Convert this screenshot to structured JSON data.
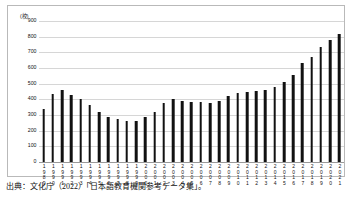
{
  "figure": {
    "source_caption": "出典：文化庁（2022）「日本語教育機関参考データ集」。"
  },
  "chart_data": {
    "type": "bar",
    "title": "",
    "subtitle": "",
    "xlabel": "(年)",
    "ylabel": "(校)",
    "ylim": [
      0,
      900
    ],
    "ytick_step": 100,
    "yticks": [
      0,
      100,
      200,
      300,
      400,
      500,
      600,
      700,
      800,
      900
    ],
    "ytick_labels": [
      "0",
      "100",
      "200",
      "300",
      "400",
      "500",
      "600",
      "700",
      "800",
      "900"
    ],
    "grid": true,
    "legend": false,
    "bar_color": "#111111",
    "gridline_color": "#d6d6d6",
    "categories": [
      "1989",
      "1990",
      "1991",
      "1992",
      "1993",
      "1994",
      "1995",
      "1996",
      "1997",
      "1998",
      "1999",
      "2000",
      "2001",
      "2002",
      "2003",
      "2004",
      "2005",
      "2006",
      "2007",
      "2008",
      "2009",
      "2010",
      "2011",
      "2012",
      "2013",
      "2014",
      "2015",
      "2016",
      "2017",
      "2018",
      "2019",
      "2020",
      "2021"
    ],
    "values": [
      340,
      433,
      460,
      430,
      405,
      363,
      320,
      287,
      275,
      262,
      263,
      287,
      322,
      377,
      405,
      391,
      380,
      383,
      377,
      391,
      419,
      442,
      444,
      456,
      457,
      477,
      511,
      557,
      630,
      669,
      736,
      780,
      815
    ]
  }
}
